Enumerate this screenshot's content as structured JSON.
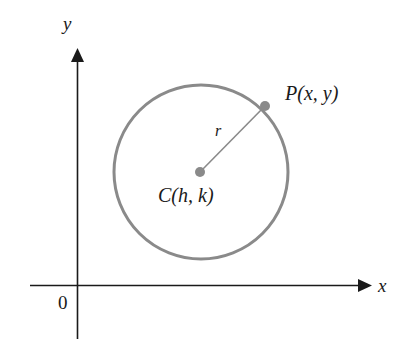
{
  "figure": {
    "background_color": "#ffffff",
    "axis_color": "#1a1a1a",
    "circle_color": "#8a8a8a",
    "radius_line_color": "#8a8a8a",
    "dot_color": "#8a8a8a",
    "label_color": "#1a1a1a"
  },
  "axes": {
    "x_axis_label": "x",
    "y_axis_label": "y",
    "origin_label": "0",
    "x_axis_y": 285,
    "y_axis_x": 77,
    "x_axis_start": 30,
    "x_axis_end": 365,
    "y_axis_top": 55,
    "y_axis_bottom": 339
  },
  "geometry": {
    "circle": {
      "cx": 201,
      "cy": 172,
      "r": 87
    },
    "center_point": {
      "x": 200,
      "y": 172,
      "label": "C(h, k)"
    },
    "circle_point": {
      "x": 265,
      "y": 106,
      "label": "P(x, y)"
    },
    "radius_segment": {
      "label": "r",
      "from": "C(h, k)",
      "to": "P(x, y)"
    }
  },
  "labels": {
    "point_p": "P(x, y)",
    "center_c": "C(h, k)",
    "radius_r": "r",
    "axis_x": "x",
    "axis_y": "y",
    "origin": "0"
  }
}
